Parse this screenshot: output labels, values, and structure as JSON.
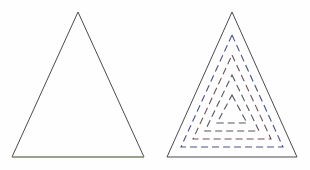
{
  "figure": {
    "background_color": "#fefefe",
    "width": 310,
    "height": 170,
    "panels": [
      {
        "id": "left-panel",
        "name": "plain-triangle-panel",
        "caption": "",
        "shapes": [
          {
            "name": "outer-triangle",
            "kind": "triangle",
            "style": "solid",
            "stroke_color": "#4a4a52",
            "stroke_width": 1,
            "fill": "none",
            "points": "78,12 144,157 12,157"
          },
          {
            "name": "base-edge-tint",
            "kind": "line",
            "style": "solid",
            "stroke_color": "#8aa06a",
            "stroke_width": 1,
            "points": "12,157 144,157"
          }
        ]
      },
      {
        "id": "right-panel",
        "name": "nested-triangle-panel",
        "caption": "",
        "shapes": [
          {
            "name": "outer-triangle",
            "kind": "triangle",
            "style": "solid",
            "stroke_color": "#4a4a52",
            "stroke_width": 1,
            "fill": "none",
            "points": "232,12 297,157 167,157"
          },
          {
            "name": "offset-triangle-1",
            "kind": "triangle",
            "style": "dashed",
            "stroke_color": "#4a4f86",
            "stroke_width": 1.1,
            "dash_pattern": "7 4",
            "fill": "none",
            "points": "232,35 283,147 181,147"
          },
          {
            "name": "offset-triangle-2",
            "kind": "triangle",
            "style": "dashed",
            "stroke_color": "#6d5258",
            "stroke_width": 1.1,
            "dash_pattern": "7 4",
            "fill": "none",
            "points": "232,55 271,139 193,139"
          },
          {
            "name": "offset-triangle-3",
            "kind": "triangle",
            "style": "dashed",
            "stroke_color": "#55555f",
            "stroke_width": 1.1,
            "dash_pattern": "7 4",
            "fill": "none",
            "points": "232,75 259,131 205,131"
          },
          {
            "name": "offset-triangle-4",
            "kind": "triangle",
            "style": "dashed",
            "stroke_color": "#55555f",
            "stroke_width": 1.1,
            "dash_pattern": "7 4",
            "fill": "none",
            "points": "232,95 247,123 217,123"
          }
        ]
      }
    ],
    "colors": {
      "outline": "#4a4a52",
      "dash_blue": "#4a4f86",
      "dash_red": "#6d5258",
      "dash_gray": "#55555f",
      "base_tint": "#8aa06a",
      "background": "#fefefe"
    }
  }
}
